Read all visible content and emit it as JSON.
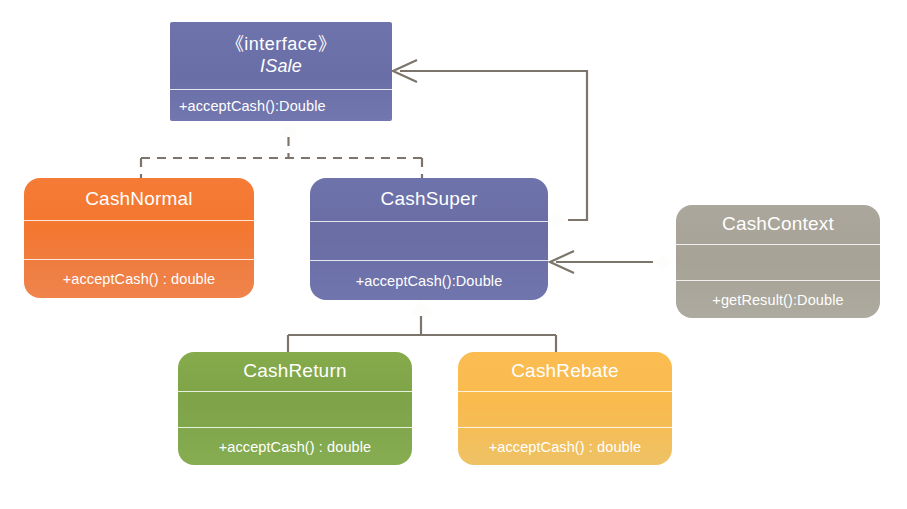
{
  "diagram": {
    "background": "#ffffff",
    "line_color": "#7c756b"
  },
  "classes": [
    {
      "id": "isale",
      "stereotype": "《interface》",
      "name": "ISale",
      "attributes": [],
      "operations": [
        "+acceptCash():Double"
      ],
      "color": "#6f73ab",
      "shape": "sharp",
      "compartments": 2
    },
    {
      "id": "cashnormal",
      "stereotype": "",
      "name": "CashNormal",
      "attributes": [],
      "operations": [
        "+acceptCash() : double"
      ],
      "color": "#f4772f",
      "shape": "rounded",
      "compartments": 3
    },
    {
      "id": "cashsuper",
      "stereotype": "",
      "name": "CashSuper",
      "attributes": [],
      "operations": [
        "+acceptCash():Double"
      ],
      "color": "#6f73ab",
      "shape": "rounded",
      "compartments": 3
    },
    {
      "id": "cashcontext",
      "stereotype": "",
      "name": "CashContext",
      "attributes": [],
      "operations": [
        "+getResult():Double"
      ],
      "color": "#a6a296",
      "shape": "rounded",
      "compartments": 3
    },
    {
      "id": "cashreturn",
      "stereotype": "",
      "name": "CashReturn",
      "attributes": [],
      "operations": [
        "+acceptCash() : double"
      ],
      "color": "#7ea348",
      "shape": "rounded",
      "compartments": 3
    },
    {
      "id": "cashrebate",
      "stereotype": "",
      "name": "CashRebate",
      "attributes": [],
      "operations": [
        "+acceptCash() : double"
      ],
      "color": "#f9ba4e",
      "shape": "rounded",
      "compartments": 3
    }
  ],
  "relationships": [
    {
      "id": "realize-cashnormal-isale",
      "type": "realization",
      "from": "CashNormal",
      "to": "ISale",
      "style": "dashed",
      "head": "hollow-triangle"
    },
    {
      "id": "realize-cashsuper-isale",
      "type": "realization",
      "from": "CashSuper",
      "to": "ISale",
      "style": "dashed",
      "head": "hollow-triangle"
    },
    {
      "id": "generalize-cashreturn-cashsuper",
      "type": "generalization",
      "from": "CashReturn",
      "to": "CashSuper",
      "style": "solid",
      "head": "hollow-triangle"
    },
    {
      "id": "generalize-cashrebate-cashsuper",
      "type": "generalization",
      "from": "CashRebate",
      "to": "CashSuper",
      "style": "solid",
      "head": "hollow-triangle"
    },
    {
      "id": "aggregate-cashsuper-isale",
      "type": "aggregation",
      "from": "CashSuper",
      "to": "ISale",
      "style": "solid",
      "head": "open-arrow",
      "tail": "hollow-diamond"
    },
    {
      "id": "aggregate-cashcontext-cashsuper",
      "type": "aggregation",
      "from": "CashContext",
      "to": "CashSuper",
      "style": "solid",
      "head": "open-arrow",
      "tail": "hollow-diamond"
    }
  ]
}
